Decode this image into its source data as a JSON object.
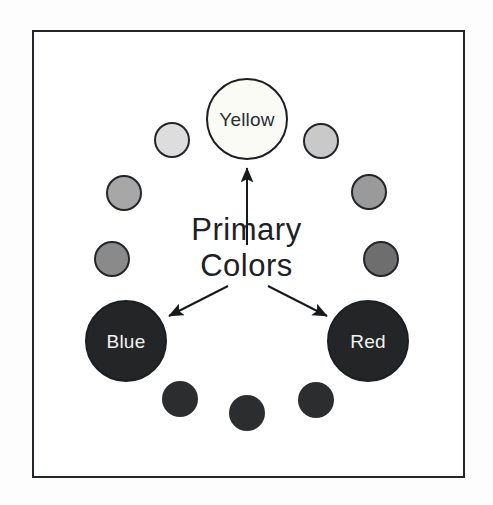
{
  "diagram": {
    "title": "Primary Colors",
    "caption_lines": [
      "Primary",
      "Colors"
    ],
    "frame_color": "#23272b",
    "background": "#ffffff",
    "arrow_color": "#16191c",
    "nodes": [
      {
        "id": "yellow",
        "label": "Yellow",
        "role": "primary",
        "cx": 247,
        "cy": 119,
        "r": 41,
        "fill": "#fbfbf6",
        "stroke": "#1c1f22",
        "label_color": "#2a2e33",
        "label_class": "label-dark"
      },
      {
        "id": "yellow-orange",
        "label": "",
        "role": "minor",
        "cx": 321,
        "cy": 141,
        "r": 18,
        "fill": "#c9c9c9",
        "stroke": "#22262a",
        "label_color": "",
        "label_class": ""
      },
      {
        "id": "orange",
        "label": "",
        "role": "minor",
        "cx": 369,
        "cy": 192,
        "r": 18,
        "fill": "#9a9a9a",
        "stroke": "#22262a",
        "label_color": "",
        "label_class": ""
      },
      {
        "id": "red-orange",
        "label": "",
        "role": "minor",
        "cx": 381,
        "cy": 259,
        "r": 18,
        "fill": "#6e6e6e",
        "stroke": "#22262a",
        "label_color": "",
        "label_class": ""
      },
      {
        "id": "red",
        "label": "Red",
        "role": "primary",
        "cx": 368,
        "cy": 341,
        "r": 41,
        "fill": "#232527",
        "stroke": "#1c1f22",
        "label_color": "#f2f2f2",
        "label_class": "label-light"
      },
      {
        "id": "red-violet",
        "label": "",
        "role": "dark-minor",
        "cx": 316,
        "cy": 400,
        "r": 18,
        "fill": "#2b2d2f",
        "stroke": "",
        "label_color": "",
        "label_class": ""
      },
      {
        "id": "violet",
        "label": "",
        "role": "dark-minor",
        "cx": 247,
        "cy": 413,
        "r": 18,
        "fill": "#2b2d2f",
        "stroke": "",
        "label_color": "",
        "label_class": ""
      },
      {
        "id": "blue-violet",
        "label": "",
        "role": "dark-minor",
        "cx": 180,
        "cy": 399,
        "r": 18,
        "fill": "#2b2d2f",
        "stroke": "",
        "label_color": "",
        "label_class": ""
      },
      {
        "id": "blue",
        "label": "Blue",
        "role": "primary",
        "cx": 126,
        "cy": 341,
        "r": 41,
        "fill": "#232527",
        "stroke": "#1c1f22",
        "label_color": "#f2f2f2",
        "label_class": "label-light"
      },
      {
        "id": "blue-green",
        "label": "",
        "role": "minor",
        "cx": 112,
        "cy": 259,
        "r": 18,
        "fill": "#8a8a8a",
        "stroke": "#22262a",
        "label_color": "",
        "label_class": ""
      },
      {
        "id": "green",
        "label": "",
        "role": "minor",
        "cx": 124,
        "cy": 193,
        "r": 18,
        "fill": "#a7a7a7",
        "stroke": "#22262a",
        "label_color": "",
        "label_class": ""
      },
      {
        "id": "yellow-green",
        "label": "",
        "role": "minor",
        "cx": 172,
        "cy": 140,
        "r": 18,
        "fill": "#dddddd",
        "stroke": "#22262a",
        "label_color": "",
        "label_class": ""
      }
    ],
    "arrows": [
      {
        "id": "arrow-to-yellow",
        "x1": 247,
        "y1": 245,
        "x2": 247,
        "y2": 168
      },
      {
        "id": "arrow-to-blue",
        "x1": 228,
        "y1": 286,
        "x2": 169,
        "y2": 316
      },
      {
        "id": "arrow-to-red",
        "x1": 268,
        "y1": 286,
        "x2": 327,
        "y2": 316
      }
    ]
  }
}
